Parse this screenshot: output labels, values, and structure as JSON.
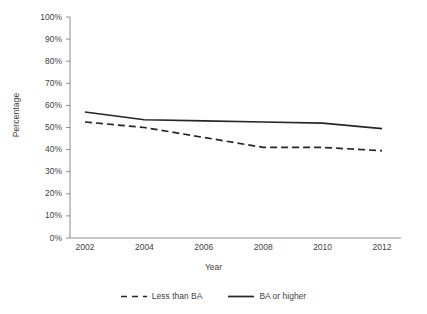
{
  "chart_data": {
    "type": "line",
    "title": "",
    "xlabel": "Year",
    "ylabel": "Percentage",
    "x": [
      2002,
      2004,
      2006,
      2008,
      2010,
      2012
    ],
    "xtick_labels": [
      "2002",
      "2004",
      "2006",
      "2008",
      "2010",
      "2012"
    ],
    "xlim": [
      2001,
      2013
    ],
    "ylim": [
      0,
      100
    ],
    "ytick_labels": [
      "0%",
      "10%",
      "20%",
      "30%",
      "40%",
      "50%",
      "60%",
      "70%",
      "80%",
      "90%",
      "100%"
    ],
    "ytick_values": [
      0,
      10,
      20,
      30,
      40,
      50,
      60,
      70,
      80,
      90,
      100
    ],
    "grid": false,
    "legend_position": "bottom",
    "series": [
      {
        "name": "Less than BA",
        "style": "dashed",
        "color": "#262626",
        "values": [
          52.5,
          50.0,
          45.5,
          41.0,
          41.0,
          39.5
        ]
      },
      {
        "name": "BA or higher",
        "style": "solid",
        "color": "#262626",
        "values": [
          57.0,
          53.5,
          53.0,
          52.5,
          52.0,
          49.5
        ]
      }
    ]
  },
  "axis": {
    "line_color": "#8c8c8c",
    "tick_color": "#8c8c8c"
  }
}
